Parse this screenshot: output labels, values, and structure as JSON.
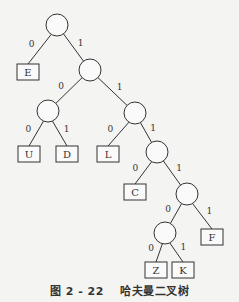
{
  "diagram": {
    "type": "huffman-binary-tree",
    "caption": {
      "number": "图 2 - 22",
      "title": "哈夫曼二叉树"
    },
    "internal_nodes": [
      {
        "id": "root",
        "cx": 57,
        "cy": 25
      },
      {
        "id": "n1",
        "cx": 90,
        "cy": 70
      },
      {
        "id": "n2",
        "cx": 48,
        "cy": 111
      },
      {
        "id": "n3",
        "cx": 135,
        "cy": 113
      },
      {
        "id": "n4",
        "cx": 157,
        "cy": 152
      },
      {
        "id": "n5",
        "cx": 187,
        "cy": 194
      },
      {
        "id": "n6",
        "cx": 165,
        "cy": 233
      }
    ],
    "leaves": [
      {
        "id": "E",
        "label": "E",
        "x": 17,
        "y": 64
      },
      {
        "id": "U",
        "label": "U",
        "x": 18,
        "y": 146
      },
      {
        "id": "D",
        "label": "D",
        "x": 56,
        "y": 146
      },
      {
        "id": "L",
        "label": "L",
        "x": 97,
        "y": 146
      },
      {
        "id": "C",
        "label": "C",
        "x": 124,
        "y": 184
      },
      {
        "id": "F",
        "label": "F",
        "x": 201,
        "y": 229
      },
      {
        "id": "Z",
        "label": "Z",
        "x": 145,
        "y": 262
      },
      {
        "id": "K",
        "label": "K",
        "x": 172,
        "y": 262
      }
    ],
    "edges": [
      {
        "from": "root",
        "to": "E",
        "bit": "0"
      },
      {
        "from": "root",
        "to": "n1",
        "bit": "1"
      },
      {
        "from": "n1",
        "to": "n2",
        "bit": "0"
      },
      {
        "from": "n1",
        "to": "n3",
        "bit": "1"
      },
      {
        "from": "n2",
        "to": "U",
        "bit": "0"
      },
      {
        "from": "n2",
        "to": "D",
        "bit": "1"
      },
      {
        "from": "n3",
        "to": "L",
        "bit": "0"
      },
      {
        "from": "n3",
        "to": "n4",
        "bit": "1"
      },
      {
        "from": "n4",
        "to": "C",
        "bit": "0"
      },
      {
        "from": "n4",
        "to": "n5",
        "bit": "1"
      },
      {
        "from": "n5",
        "to": "n6",
        "bit": "0"
      },
      {
        "from": "n5",
        "to": "F",
        "bit": "1"
      },
      {
        "from": "n6",
        "to": "Z",
        "bit": "0"
      },
      {
        "from": "n6",
        "to": "K",
        "bit": "1"
      }
    ],
    "style": {
      "stroke": "#333333",
      "node_radius": 11,
      "leaf_w": 22,
      "leaf_h": 16
    }
  }
}
